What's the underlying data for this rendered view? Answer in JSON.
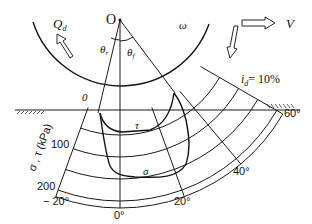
{
  "diagram": {
    "type": "wheel-soil interaction stress distribution",
    "labels": {
      "center": "O",
      "torque": "Q",
      "torque_sub": "d",
      "angular_velocity": "ω",
      "velocity": "V",
      "theta_r": "θ",
      "theta_r_sub": "r",
      "theta_f": "θ",
      "theta_f_sub": "f",
      "zero_mark": "0",
      "slip": "i",
      "slip_sub": "d",
      "slip_value": "= 10%",
      "tau_curve": "τ",
      "sigma_curve": "σ",
      "radial_axis": "σ , τ (kPa)"
    },
    "radial_ticks": [
      "100",
      "200"
    ],
    "angle_ticks": [
      "− 20°",
      "0°",
      "20°",
      "40°",
      "60°"
    ]
  }
}
